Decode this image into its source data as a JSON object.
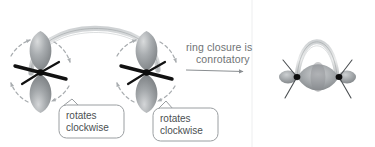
{
  "figure": {
    "kind": "chemistry-reaction-diagram",
    "topic": "electrocyclic ring closure",
    "background_color": "#ffffff"
  },
  "reaction": {
    "arrow_label_line1": "ring closure is",
    "arrow_label_line2": "conrotatory",
    "arrow_color": "#8b8f92",
    "label_color": "#6f7375"
  },
  "callouts": [
    {
      "id": "left",
      "line1": "rotates",
      "line2": "clockwise",
      "border_color": "#9a9ea1",
      "fill_color": "#ffffff",
      "text_color": "#4b4f52"
    },
    {
      "id": "right",
      "line1": "rotates",
      "line2": "clockwise",
      "border_color": "#9a9ea1",
      "fill_color": "#ffffff",
      "text_color": "#4b4f52"
    }
  ],
  "reactant": {
    "name": "open-chain-diene-termini",
    "orbitals": [
      {
        "id": "left-p-orbital",
        "label": "p orbital",
        "lobe_color": "#9b9fa2",
        "node_color": "#111111"
      },
      {
        "id": "right-p-orbital",
        "label": "p orbital",
        "lobe_color": "#9b9fa2",
        "node_color": "#111111"
      }
    ],
    "connector": {
      "id": "pi-ribbon",
      "label": "pi system ribbon",
      "color": "#b9bcbe"
    },
    "rotation_arrows": {
      "direction": "clockwise",
      "count_per_orbital": 4,
      "color": "#a9adb0",
      "style": "dashed"
    }
  },
  "product": {
    "name": "closed-ring-sigma-bond",
    "body": {
      "id": "sigma-lens",
      "label": "sigma bond lens",
      "color": "#9b9fa2"
    },
    "arch": {
      "id": "ring-arch-ribbon",
      "label": "ring arch ribbon",
      "color": "#b9bcbe"
    },
    "nodes": {
      "count": 2,
      "color": "#111111"
    },
    "end_lobes": {
      "count": 2,
      "color": "#9b9fa2"
    },
    "substituent_lines": {
      "count": 4,
      "color": "#4b4f52"
    }
  },
  "divider": {
    "id": "panel-divider",
    "color": "#e8eaeb",
    "x": 252
  }
}
